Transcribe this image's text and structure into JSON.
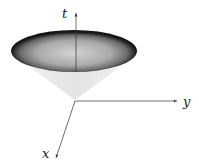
{
  "diagram": {
    "type": "light-cone",
    "axes": {
      "t": {
        "label": "t"
      },
      "x": {
        "label": "x"
      },
      "y": {
        "label": "y"
      }
    },
    "colors": {
      "cone_fill": "#ebebeb",
      "cap_center": "#cfcfcf",
      "cap_edge": "#1a1a1a",
      "axis": "#333333"
    }
  }
}
